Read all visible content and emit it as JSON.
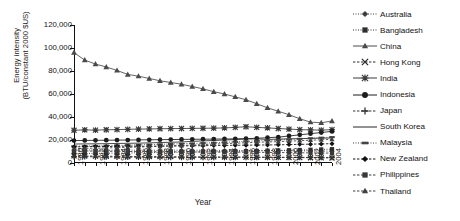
{
  "chart_data": {
    "type": "line",
    "title": "",
    "xlabel": "Year",
    "ylabel": "Energy intensity (BTU/constant 2000 $US)",
    "ylabel_lines": [
      "Energy intensity",
      "(BTU/constant 2000 $US)"
    ],
    "ylim": [
      0,
      120000
    ],
    "ytick_values": [
      0,
      20000,
      40000,
      60000,
      80000,
      100000,
      120000
    ],
    "ytick_labels": [
      "0",
      "20,000",
      "40,000",
      "60,000",
      "80,000",
      "100,000",
      "120,000"
    ],
    "xlim": [
      1980,
      2004
    ],
    "x": [
      1980,
      1981,
      1982,
      1983,
      1984,
      1985,
      1986,
      1987,
      1988,
      1989,
      1990,
      1991,
      1992,
      1993,
      1994,
      1995,
      1996,
      1997,
      1998,
      1999,
      2000,
      2001,
      2002,
      2003,
      2004
    ],
    "xtick_labels": [
      "1980",
      "1982",
      "1984",
      "1986",
      "1988",
      "1990",
      "1992",
      "1994",
      "1996",
      "1998",
      "2000",
      "2002",
      "2004"
    ],
    "xtick_values": [
      1980,
      1982,
      1984,
      1986,
      1988,
      1990,
      1992,
      1994,
      1996,
      1998,
      2000,
      2002,
      2004
    ],
    "grid": false,
    "legend_position": "right",
    "series": [
      {
        "name": "Australia",
        "marker": "diamond",
        "linestyle": "dotted",
        "color": "#3d3d3d",
        "values": [
          11200,
          11300,
          11200,
          11000,
          11100,
          11200,
          11100,
          11000,
          11100,
          11200,
          11100,
          11000,
          11100,
          11000,
          10900,
          11000,
          10900,
          10800,
          10900,
          10800,
          10700,
          10600,
          10500,
          10400,
          10300
        ]
      },
      {
        "name": "Bangladesh",
        "marker": "square",
        "linestyle": "dotted",
        "color": "#2e2e2e",
        "values": [
          8200,
          8300,
          8400,
          8500,
          8600,
          8700,
          8900,
          9000,
          9100,
          9300,
          9400,
          9500,
          9700,
          9800,
          9900,
          10100,
          10300,
          10500,
          10700,
          10900,
          11100,
          11300,
          11500,
          11800,
          12000
        ]
      },
      {
        "name": "China",
        "marker": "triangle",
        "linestyle": "solid",
        "color": "#4a4a4a",
        "values": [
          96000,
          89500,
          86000,
          83500,
          80500,
          77000,
          75500,
          73500,
          71500,
          70000,
          68500,
          66500,
          64500,
          62000,
          60000,
          57500,
          55000,
          51500,
          48000,
          45000,
          42000,
          38500,
          35500,
          35000,
          36500
        ]
      },
      {
        "name": "Hong Kong",
        "marker": "x",
        "linestyle": "dashed",
        "color": "#2a2a2a",
        "values": [
          6200,
          6100,
          6000,
          5900,
          5800,
          5700,
          5700,
          5600,
          5500,
          5500,
          5400,
          5400,
          5300,
          5300,
          5200,
          5200,
          5100,
          5000,
          5000,
          4900,
          4800,
          4700,
          4600,
          4500,
          4400
        ]
      },
      {
        "name": "India",
        "marker": "asterisk",
        "linestyle": "solid",
        "color": "#3a3a3a",
        "values": [
          28500,
          28800,
          28600,
          28900,
          29000,
          29300,
          29500,
          29600,
          29800,
          29900,
          30000,
          30100,
          30200,
          30300,
          30500,
          31000,
          31500,
          31000,
          30500,
          30000,
          29500,
          29000,
          28800,
          28600,
          29000
        ]
      },
      {
        "name": "Indonesia",
        "marker": "circle",
        "linestyle": "solid",
        "color": "#1c1c1c",
        "values": [
          19500,
          19600,
          19700,
          19800,
          19900,
          20000,
          20100,
          20200,
          20300,
          20400,
          20500,
          20600,
          20700,
          20800,
          20900,
          21000,
          21200,
          21500,
          22000,
          22500,
          23500,
          24500,
          25500,
          26500,
          27500
        ]
      },
      {
        "name": "Japan",
        "marker": "plus",
        "linestyle": "dashed",
        "color": "#333333",
        "values": [
          5600,
          5500,
          5400,
          5300,
          5200,
          5100,
          5050,
          5000,
          5000,
          4950,
          4900,
          4900,
          4900,
          4900,
          4950,
          4950,
          4950,
          4900,
          4900,
          4900,
          4900,
          4850,
          4850,
          4800,
          4800
        ]
      },
      {
        "name": "South Korea",
        "marker": "none",
        "linestyle": "solid",
        "color": "#262626",
        "values": [
          16500,
          16600,
          16700,
          16800,
          17000,
          17100,
          17300,
          17500,
          17800,
          18000,
          18300,
          18800,
          19200,
          19600,
          20000,
          20400,
          20800,
          21000,
          20500,
          20800,
          21000,
          21200,
          21400,
          21600,
          21800
        ]
      },
      {
        "name": "Malaysia",
        "marker": "dash",
        "linestyle": "dotted",
        "color": "#444444",
        "values": [
          14500,
          14700,
          14900,
          15100,
          15300,
          15500,
          15800,
          16000,
          16200,
          16500,
          16800,
          17000,
          17300,
          17600,
          18000,
          18400,
          18800,
          19200,
          19600,
          20000,
          20500,
          21000,
          21500,
          22000,
          22500
        ]
      },
      {
        "name": "New Zealand",
        "marker": "diamond",
        "linestyle": "dashed",
        "color": "#111111",
        "values": [
          14000,
          14200,
          14400,
          14300,
          14500,
          14600,
          14500,
          14600,
          14700,
          14800,
          14900,
          15000,
          15100,
          15200,
          15300,
          15400,
          15500,
          15600,
          15700,
          15800,
          16000,
          16200,
          16400,
          16600,
          16800
        ]
      },
      {
        "name": "Philippines",
        "marker": "square",
        "linestyle": "dashed",
        "color": "#383838",
        "values": [
          10500,
          10400,
          10300,
          10200,
          10100,
          10000,
          9900,
          9800,
          9800,
          9700,
          9700,
          9600,
          9600,
          9500,
          9500,
          9400,
          9400,
          9300,
          9200,
          9100,
          9000,
          8900,
          8800,
          8700,
          8600
        ]
      },
      {
        "name": "Thailand",
        "marker": "triangle",
        "linestyle": "dashed",
        "color": "#3f3f3f",
        "values": [
          12500,
          12700,
          12900,
          13100,
          13400,
          13600,
          13900,
          14200,
          14500,
          14900,
          15200,
          15600,
          16000,
          16400,
          16800,
          17200,
          17600,
          18000,
          18300,
          18600,
          19000,
          19400,
          19800,
          20200,
          20600
        ]
      }
    ]
  }
}
